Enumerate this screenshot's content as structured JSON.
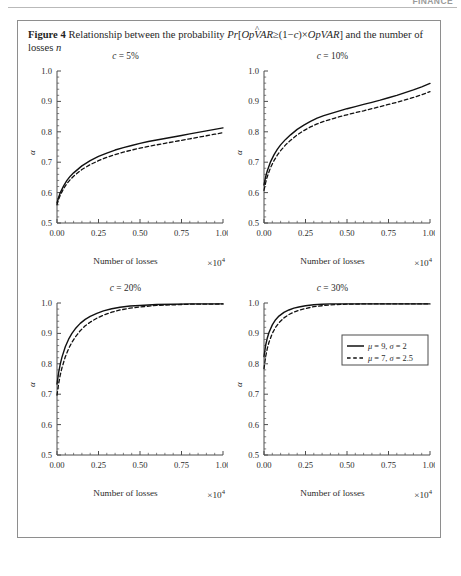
{
  "running_head": {
    "text": "FINANCE"
  },
  "caption": {
    "label": "Figure 4",
    "text_part1": "Relationship between the probability ",
    "formula_pr": "Pr",
    "formula_open": "[",
    "formula_opvar_hat": "OpVAR",
    "formula_mid": "≥(1−",
    "formula_c": "c",
    "formula_times": ")×",
    "formula_opvar": "OpVAR",
    "formula_close": "]",
    "text_part2": " and the number of losses ",
    "formula_n": "n"
  },
  "axes": {
    "x_ticks": [
      "0.00",
      "0.25",
      "0.50",
      "0.75",
      "1.00"
    ],
    "x_tick_values": [
      0.0,
      0.25,
      0.5,
      0.75,
      1.0
    ],
    "x_title": "Number of losses",
    "x_exponent_base": "×10",
    "x_exponent_power": "4",
    "y_label": "α",
    "y_ticks_top": [
      "1.0",
      "0.9",
      "0.8",
      "0.7",
      "0.6",
      "0.5"
    ],
    "y_tick_values_top": [
      1.0,
      0.9,
      0.8,
      0.7,
      0.6,
      0.5
    ],
    "y_ticks_bottom": [
      "1.0",
      "0.9",
      "0.8",
      "0.7",
      "0.6",
      "0.5"
    ],
    "y_tick_values_bottom": [
      1.0,
      0.9,
      0.8,
      0.7,
      0.6,
      0.5
    ]
  },
  "legend": {
    "position": "bottom-right-panel",
    "entries": [
      {
        "style": "solid",
        "mu_label": "μ",
        "mu_value": "9",
        "sigma_label": "σ",
        "sigma_value": "2",
        "text": "μ = 9, σ = 2"
      },
      {
        "style": "dashed",
        "mu_label": "μ",
        "mu_value": "7",
        "sigma_label": "σ",
        "sigma_value": "2.5",
        "text": "μ = 7, σ = 2.5"
      }
    ]
  },
  "colors": {
    "line": "#111111",
    "axis": "#4d4d4d",
    "frame": "#8e8e8e",
    "text": "#2b2b2b"
  },
  "chart_data": [
    {
      "type": "line",
      "id": "panel-c5",
      "title": "c = 5%",
      "title_var": "c",
      "title_value": "5%",
      "xlabel": "Number of losses",
      "x_exponent": "×10⁴",
      "ylabel": "α",
      "xlim": [
        0.0,
        1.0
      ],
      "ylim": [
        0.5,
        1.0
      ],
      "grid": false,
      "x": [
        0.0,
        0.01,
        0.02,
        0.04,
        0.06,
        0.08,
        0.1,
        0.15,
        0.2,
        0.25,
        0.3,
        0.35,
        0.4,
        0.45,
        0.5,
        0.55,
        0.6,
        0.65,
        0.7,
        0.75,
        0.8,
        0.85,
        0.9,
        0.95,
        1.0
      ],
      "series": [
        {
          "name": "μ = 9, σ = 2",
          "style": "solid",
          "values": [
            0.566,
            0.585,
            0.6,
            0.622,
            0.64,
            0.654,
            0.665,
            0.688,
            0.705,
            0.719,
            0.73,
            0.74,
            0.748,
            0.755,
            0.762,
            0.768,
            0.773,
            0.778,
            0.783,
            0.788,
            0.793,
            0.798,
            0.803,
            0.808,
            0.813
          ]
        },
        {
          "name": "μ = 7, σ = 2.5",
          "style": "dashed",
          "values": [
            0.56,
            0.578,
            0.592,
            0.613,
            0.63,
            0.643,
            0.654,
            0.676,
            0.692,
            0.705,
            0.716,
            0.725,
            0.733,
            0.74,
            0.746,
            0.752,
            0.757,
            0.762,
            0.767,
            0.772,
            0.777,
            0.782,
            0.787,
            0.792,
            0.797
          ]
        }
      ]
    },
    {
      "type": "line",
      "id": "panel-c10",
      "title": "c = 10%",
      "title_var": "c",
      "title_value": "10%",
      "xlabel": "Number of losses",
      "x_exponent": "×10⁴",
      "ylabel": "α",
      "xlim": [
        0.0,
        1.0
      ],
      "ylim": [
        0.5,
        1.0
      ],
      "grid": false,
      "x": [
        0.0,
        0.01,
        0.02,
        0.04,
        0.06,
        0.08,
        0.1,
        0.13,
        0.16,
        0.2,
        0.24,
        0.28,
        0.32,
        0.36,
        0.4,
        0.45,
        0.5,
        0.55,
        0.6,
        0.65,
        0.7,
        0.75,
        0.8,
        0.85,
        0.9,
        0.95,
        1.0
      ],
      "series": [
        {
          "name": "μ = 9, σ = 2",
          "style": "solid",
          "values": [
            0.625,
            0.652,
            0.672,
            0.702,
            0.724,
            0.742,
            0.757,
            0.775,
            0.79,
            0.808,
            0.822,
            0.834,
            0.845,
            0.853,
            0.86,
            0.868,
            0.876,
            0.883,
            0.89,
            0.897,
            0.904,
            0.912,
            0.92,
            0.929,
            0.938,
            0.948,
            0.959
          ]
        },
        {
          "name": "μ = 7, σ = 2.5",
          "style": "dashed",
          "values": [
            0.607,
            0.633,
            0.653,
            0.683,
            0.705,
            0.723,
            0.738,
            0.757,
            0.772,
            0.79,
            0.804,
            0.816,
            0.826,
            0.834,
            0.841,
            0.849,
            0.856,
            0.863,
            0.869,
            0.876,
            0.883,
            0.89,
            0.897,
            0.905,
            0.913,
            0.922,
            0.932
          ]
        }
      ]
    },
    {
      "type": "line",
      "id": "panel-c20",
      "title": "c = 20%",
      "title_var": "c",
      "title_value": "20%",
      "xlabel": "Number of losses",
      "x_exponent": "×10⁴",
      "ylabel": "α",
      "xlim": [
        0.0,
        1.0
      ],
      "ylim": [
        0.5,
        1.0
      ],
      "grid": false,
      "x": [
        0.0,
        0.01,
        0.02,
        0.03,
        0.05,
        0.07,
        0.09,
        0.11,
        0.14,
        0.17,
        0.2,
        0.24,
        0.28,
        0.33,
        0.38,
        0.44,
        0.5,
        0.6,
        0.7,
        0.8,
        0.9,
        1.0
      ],
      "series": [
        {
          "name": "μ = 9, σ = 2",
          "style": "solid",
          "values": [
            0.733,
            0.772,
            0.8,
            0.822,
            0.856,
            0.881,
            0.9,
            0.915,
            0.933,
            0.946,
            0.956,
            0.966,
            0.974,
            0.981,
            0.986,
            0.99,
            0.992,
            0.995,
            0.996,
            0.997,
            0.997,
            0.997
          ]
        },
        {
          "name": "μ = 7, σ = 2.5",
          "style": "dashed",
          "values": [
            0.697,
            0.735,
            0.764,
            0.787,
            0.823,
            0.85,
            0.871,
            0.888,
            0.909,
            0.925,
            0.937,
            0.95,
            0.96,
            0.97,
            0.977,
            0.983,
            0.987,
            0.992,
            0.994,
            0.996,
            0.996,
            0.997
          ]
        }
      ]
    },
    {
      "type": "line",
      "id": "panel-c30",
      "title": "c = 30%",
      "title_var": "c",
      "title_value": "30%",
      "xlabel": "Number of losses",
      "x_exponent": "×10⁴",
      "ylabel": "α",
      "xlim": [
        0.0,
        1.0
      ],
      "ylim": [
        0.5,
        1.0
      ],
      "grid": false,
      "x": [
        0.0,
        0.01,
        0.02,
        0.03,
        0.05,
        0.07,
        0.09,
        0.12,
        0.15,
        0.18,
        0.21,
        0.25,
        0.3,
        0.35,
        0.4,
        0.5,
        0.6,
        0.7,
        0.8,
        0.9,
        1.0
      ],
      "series": [
        {
          "name": "μ = 9, σ = 2",
          "style": "solid",
          "values": [
            0.824,
            0.861,
            0.885,
            0.903,
            0.928,
            0.945,
            0.957,
            0.969,
            0.977,
            0.983,
            0.987,
            0.991,
            0.994,
            0.996,
            0.997,
            0.997,
            0.997,
            0.997,
            0.997,
            0.997,
            0.997
          ]
        },
        {
          "name": "μ = 7, σ = 2.5",
          "style": "dashed",
          "values": [
            0.784,
            0.824,
            0.851,
            0.871,
            0.9,
            0.92,
            0.935,
            0.951,
            0.962,
            0.97,
            0.976,
            0.982,
            0.988,
            0.991,
            0.994,
            0.996,
            0.997,
            0.997,
            0.997,
            0.997,
            0.997
          ]
        }
      ]
    }
  ]
}
